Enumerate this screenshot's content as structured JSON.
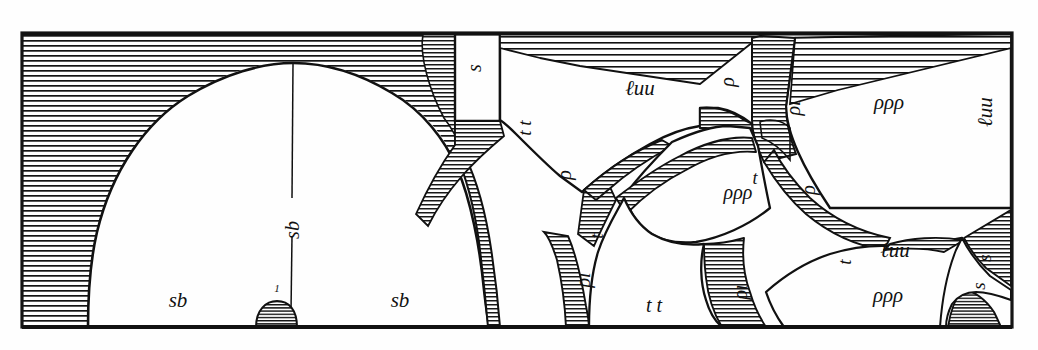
{
  "plate": {
    "kind": "engraved-plate",
    "title": "Cross-section engraving with arched vault and hatched strata",
    "frame": {
      "x": 22,
      "y": 33,
      "width": 990,
      "height": 294,
      "ink": "#1a1a1a",
      "paper": "#fefefe"
    }
  },
  "labels": [
    {
      "id": "sb-left",
      "text": "sb",
      "x": 178,
      "y": 300,
      "size": 21,
      "rotate": 0,
      "style": "italic",
      "region": "vault-interior-left"
    },
    {
      "id": "sb-right",
      "text": "sb",
      "x": 400,
      "y": 300,
      "size": 21,
      "rotate": 0,
      "style": "italic",
      "region": "vault-interior-right"
    },
    {
      "id": "sb-axis",
      "text": "sb",
      "x": 292,
      "y": 230,
      "size": 20,
      "rotate": -90,
      "style": "italic",
      "region": "vault-axis"
    },
    {
      "id": "one-marker",
      "text": "1",
      "x": 277,
      "y": 288,
      "size": 11,
      "rotate": 0,
      "style": "italic",
      "region": "vault-base-marker"
    },
    {
      "id": "s-top-box",
      "text": "s",
      "x": 474,
      "y": 68,
      "size": 20,
      "rotate": -90,
      "style": "italic",
      "region": "top-white-box"
    },
    {
      "id": "tt-upper",
      "text": "t t",
      "x": 524,
      "y": 128,
      "size": 19,
      "rotate": -90,
      "style": "italic",
      "region": "arch-right-band"
    },
    {
      "id": "luu-top",
      "text": "ℓuu",
      "x": 640,
      "y": 88,
      "size": 21,
      "rotate": 0,
      "style": "italic",
      "region": "upper-middle-panel"
    },
    {
      "id": "rho-top",
      "text": "ρ",
      "x": 727,
      "y": 82,
      "size": 20,
      "rotate": -90,
      "style": "italic",
      "region": "upper-middle-panel"
    },
    {
      "id": "rho-i-upper",
      "text": "ρı",
      "x": 793,
      "y": 108,
      "size": 20,
      "rotate": -90,
      "style": "italic",
      "region": "upper-right-wedge"
    },
    {
      "id": "rho3-upper",
      "text": "ρρρ",
      "x": 889,
      "y": 102,
      "size": 21,
      "rotate": 0,
      "style": "italic",
      "region": "right-panel"
    },
    {
      "id": "luu-right",
      "text": "ℓuu",
      "x": 985,
      "y": 112,
      "size": 21,
      "rotate": -90,
      "style": "italic",
      "region": "right-panel-edge"
    },
    {
      "id": "rho-midleft",
      "text": "ρ",
      "x": 564,
      "y": 175,
      "size": 20,
      "rotate": -90,
      "style": "italic",
      "region": "mid-left-facet"
    },
    {
      "id": "t-mid",
      "text": "t",
      "x": 596,
      "y": 236,
      "size": 19,
      "rotate": -90,
      "style": "italic",
      "region": "mid-centre-facet"
    },
    {
      "id": "rho3-mid",
      "text": "ρρρ",
      "x": 738,
      "y": 192,
      "size": 20,
      "rotate": 0,
      "style": "italic",
      "region": "mid-centre-facet"
    },
    {
      "id": "t-upper-mid",
      "text": "t",
      "x": 755,
      "y": 178,
      "size": 18,
      "rotate": 0,
      "style": "italic",
      "region": "mid-centre-facet"
    },
    {
      "id": "rho-mid-right",
      "text": "ρ",
      "x": 808,
      "y": 190,
      "size": 20,
      "rotate": -90,
      "style": "italic",
      "region": "mid-right-facet"
    },
    {
      "id": "rho-i-lower",
      "text": "ρı",
      "x": 583,
      "y": 280,
      "size": 20,
      "rotate": -90,
      "style": "italic",
      "region": "lower-left-band"
    },
    {
      "id": "tt-lower",
      "text": "t t",
      "x": 654,
      "y": 305,
      "size": 20,
      "rotate": 0,
      "style": "italic",
      "region": "lower-centre-floor"
    },
    {
      "id": "rho-i-lower2",
      "text": "ρı",
      "x": 740,
      "y": 292,
      "size": 20,
      "rotate": -90,
      "style": "italic",
      "region": "lower-centre-band"
    },
    {
      "id": "t-lower-right",
      "text": "t",
      "x": 844,
      "y": 262,
      "size": 19,
      "rotate": -90,
      "style": "italic",
      "region": "lower-right-facet"
    },
    {
      "id": "luu-lower",
      "text": "ℓuu",
      "x": 895,
      "y": 250,
      "size": 21,
      "rotate": 0,
      "style": "italic",
      "region": "lower-right-facet"
    },
    {
      "id": "rho3-lower",
      "text": "ρρρ",
      "x": 888,
      "y": 295,
      "size": 21,
      "rotate": 0,
      "style": "italic",
      "region": "lower-right-facet"
    },
    {
      "id": "s-right-upper",
      "text": "s",
      "x": 984,
      "y": 258,
      "size": 19,
      "rotate": -90,
      "style": "italic",
      "region": "right-corner-facet"
    },
    {
      "id": "s-right-lower",
      "text": "s",
      "x": 978,
      "y": 286,
      "size": 19,
      "rotate": -90,
      "style": "italic",
      "region": "right-corner-facet"
    }
  ],
  "regions": {
    "vault": {
      "name": "large-arched-vault",
      "apex_x": 293,
      "apex_y": 63,
      "springing_y": 327
    },
    "hatch_fields": [
      "upper-left-spandrel",
      "arch-right-spandrel-band",
      "top-right-ceiling-band",
      "mid-wedge-bands",
      "lower-right-bands",
      "base-dome"
    ]
  }
}
